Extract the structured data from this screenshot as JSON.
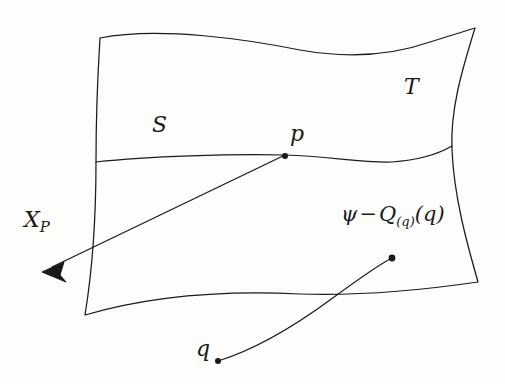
{
  "figure": {
    "width": 505,
    "height": 384,
    "background_color": "#fdfdfb",
    "ink_color": "#1a1a1a"
  },
  "labels": {
    "region_upper": "S",
    "region_right": "T",
    "point_p": "p",
    "point_q": "q",
    "tangent_vector": {
      "base": "X",
      "subscript": "P",
      "full": "X_P"
    },
    "curve_map": {
      "psi": "ψ",
      "minus": "−",
      "q_operator": "Q",
      "operator_subscript": "(q)",
      "argument": "(q)",
      "full": "ψ − Q(q)(q)"
    }
  },
  "geometry": {
    "surface_outline": "M 100 38 C 160 26 250 40 300 50 C 345 58 390 56 430 42 L 475 28 C 462 70 450 110 452 150 C 454 196 466 240 478 282 C 430 289 360 296 300 294 C 220 290 150 296 85 315 C 93 266 96 212 96 162 C 96 112 98 70 100 38 Z",
    "dividing_curve": "M 96 162 C 150 156 230 154 285 155 C 330 156 360 163 392 162 C 420 160 440 153 452 146",
    "tangent_arrow": {
      "from": [
        285,
        155
      ],
      "to": [
        42,
        272
      ],
      "head_length": 18,
      "head_width": 8
    },
    "geodesic_curve": "M 218 361 C 260 348 300 322 330 300 C 360 278 378 265 392 258",
    "dots": [
      {
        "name": "point-p-dot",
        "cx": 285,
        "cy": 156,
        "r": 3
      },
      {
        "name": "point-q-dot",
        "cx": 218,
        "cy": 361,
        "r": 3
      },
      {
        "name": "curve-endpoint-dot",
        "cx": 392,
        "cy": 258,
        "r": 3.4
      }
    ]
  }
}
